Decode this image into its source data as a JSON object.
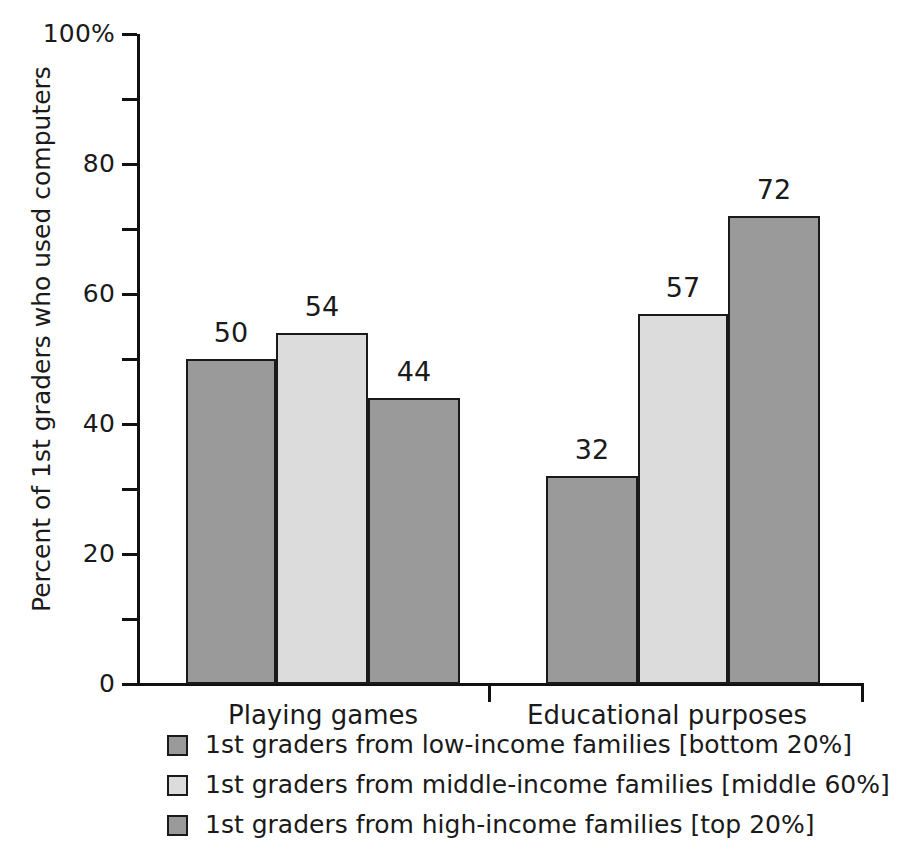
{
  "chart_data": {
    "type": "bar",
    "title": "",
    "xlabel": "",
    "ylabel": "Percent of 1st graders who used computers",
    "ylim": [
      0,
      100
    ],
    "ytick_labels": [
      "0",
      "20",
      "40",
      "60",
      "80",
      "100%"
    ],
    "ytick_values": [
      0,
      20,
      40,
      60,
      80,
      100
    ],
    "yminor_values": [
      10,
      30,
      50,
      70,
      90
    ],
    "grid": false,
    "legend_position": "bottom-left",
    "categories": [
      "Playing games",
      "Educational purposes"
    ],
    "series": [
      {
        "name": "1st graders from low-income families [bottom 20%]",
        "color": "#9a9a9a",
        "values": [
          50,
          32
        ]
      },
      {
        "name": "1st graders from middle-income families [middle 60%]",
        "color": "#dcdcdc",
        "values": [
          54,
          57
        ]
      },
      {
        "name": "1st graders from high-income families [top 20%]",
        "color": "#9a9a9a",
        "values": [
          44,
          72
        ]
      }
    ],
    "bars": [
      {
        "id": "bar-playing-low",
        "value": 50,
        "label": "50",
        "color": "#9a9a9a",
        "x": 49,
        "width": 90
      },
      {
        "id": "bar-playing-middle",
        "value": 54,
        "label": "54",
        "color": "#dcdcdc",
        "x": 139,
        "width": 92
      },
      {
        "id": "bar-playing-high",
        "value": 44,
        "label": "44",
        "color": "#9a9a9a",
        "x": 231,
        "width": 92
      },
      {
        "id": "bar-educational-low",
        "value": 32,
        "label": "32",
        "color": "#9a9a9a",
        "x": 409,
        "width": 92
      },
      {
        "id": "bar-educational-middle",
        "value": 57,
        "label": "57",
        "color": "#dcdcdc",
        "x": 501,
        "width": 90
      },
      {
        "id": "bar-educational-high",
        "value": 72,
        "label": "72",
        "color": "#9a9a9a",
        "x": 591,
        "width": 92
      }
    ],
    "axis_colors": {
      "axis_line": "#111111",
      "bar_border": "#1a1a1a",
      "text": "#1a1a1a",
      "background": "#ffffff"
    }
  }
}
